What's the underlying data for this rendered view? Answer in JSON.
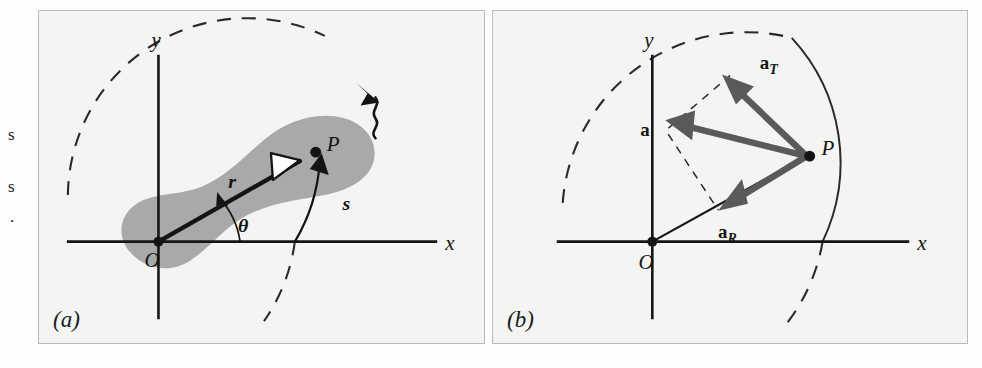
{
  "figure": {
    "type": "physics-diagram",
    "background_color": "#fdfdfd",
    "panel_fill": "#f4f4f2",
    "panel_border_color": "#b9bcbd",
    "body_shade_color": "#a9a9a9",
    "vector_color": "#5a5a5a",
    "ink_color": "#141414"
  },
  "margin_text_fragments": [
    {
      "text": "s",
      "x": 8,
      "y": 134
    },
    {
      "text": "s",
      "x": 8,
      "y": 186
    },
    {
      "text": ".",
      "x": 10,
      "y": 217
    }
  ],
  "panels": [
    {
      "id": "a",
      "caption": "(a)",
      "axes": {
        "x_label": "x",
        "y_label": "y",
        "origin_label": "O"
      },
      "labels": [
        {
          "name": "radius-label",
          "text": "r"
        },
        {
          "name": "angle-label",
          "text": "θ"
        },
        {
          "name": "arclength-label",
          "text": "s"
        },
        {
          "name": "point-label",
          "text": "P"
        }
      ],
      "annotations": {
        "rotation_arrow": "curly-arrow-indicating-rotation-sense",
        "radius_arrowhead": "hollow-white-triangle",
        "arc_arrowhead": "solid-black-arrowhead-at-P",
        "dashed_circle": "reference-circle-through-P"
      }
    },
    {
      "id": "b",
      "caption": "(b)",
      "axes": {
        "x_label": "x",
        "y_label": "y",
        "origin_label": "O"
      },
      "labels": [
        {
          "name": "point-label",
          "text": "P"
        },
        {
          "name": "tangential-accel-label",
          "text": "a",
          "subscript": "T"
        },
        {
          "name": "total-accel-label",
          "text": "a",
          "subscript": ""
        },
        {
          "name": "radial-accel-label",
          "text": "a",
          "subscript": "R"
        }
      ],
      "annotations": {
        "vectors": [
          "a_T tangential acceleration",
          "a total acceleration",
          "a_R radial (centripetal) acceleration"
        ],
        "construction_lines": "dashed parallelogram showing a = a_T + a_R",
        "dashed_circle": "reference-circle-through-P"
      }
    }
  ]
}
